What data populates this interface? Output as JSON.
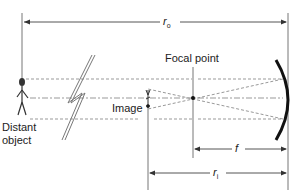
{
  "diagram": {
    "labels": {
      "r_o": "r",
      "r_o_sub": "o",
      "focal_point": "Focal point",
      "image": "Image",
      "distant_object_line1": "Distant",
      "distant_object_line2": "object",
      "f": "f",
      "r_i": "r",
      "r_i_sub": "i"
    },
    "colors": {
      "line": "#555555",
      "dashed": "#888888",
      "mirror": "#111111",
      "text": "#222222"
    }
  }
}
